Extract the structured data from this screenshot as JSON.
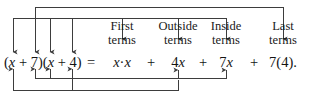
{
  "figure": {
    "ink_color": "#3d3d3d",
    "text_color": "#141414"
  },
  "equation": {
    "left_side": "(x + 7)(x + 4)",
    "equals": "=",
    "terms": [
      {
        "id": "first",
        "text": "x·x",
        "plus_after": "+"
      },
      {
        "id": "outside",
        "text": "4x",
        "plus_after": "+"
      },
      {
        "id": "inside",
        "text": "7x",
        "plus_after": "+"
      },
      {
        "id": "last",
        "text": "7(4).",
        "plus_after": ""
      }
    ]
  },
  "labels": [
    {
      "id": "first-label",
      "line1": "First",
      "line2": "terms"
    },
    {
      "id": "outside-label",
      "line1": "Outside",
      "line2": "terms"
    },
    {
      "id": "inside-label",
      "line1": "Inside",
      "line2": "terms"
    },
    {
      "id": "last-label",
      "line1": "Last",
      "line2": "terms"
    }
  ]
}
